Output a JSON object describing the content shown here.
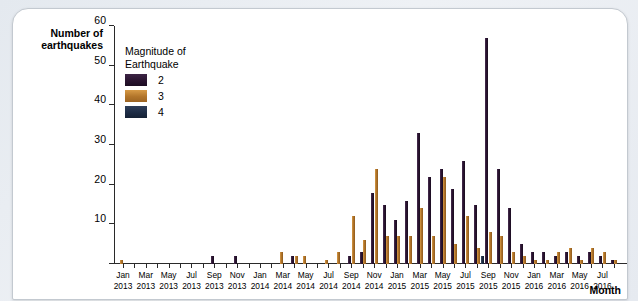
{
  "axes": {
    "y_title": "Number of earthquakes",
    "x_title": "Month",
    "y_ticks": [
      0,
      10,
      20,
      30,
      40,
      50,
      60
    ]
  },
  "legend": {
    "title_line1": "Magnitude of",
    "title_line2": "Earthquake",
    "entries": [
      {
        "label": "2",
        "color": "#2a1430"
      },
      {
        "label": "3",
        "color": "#b2752a"
      },
      {
        "label": "4",
        "color": "#1d2c45"
      }
    ]
  },
  "chart_data": {
    "type": "bar",
    "title": "",
    "xlabel": "Month",
    "ylabel": "Number of earthquakes",
    "ylim": [
      0,
      60
    ],
    "grid": false,
    "legend_position": "inside-top-left",
    "categories": [
      "Jan 2013",
      "Feb 2013",
      "Mar 2013",
      "Apr 2013",
      "May 2013",
      "Jun 2013",
      "Jul 2013",
      "Aug 2013",
      "Sep 2013",
      "Oct 2013",
      "Nov 2013",
      "Dec 2013",
      "Jan 2014",
      "Feb 2014",
      "Mar 2014",
      "Apr 2014",
      "May 2014",
      "Jun 2014",
      "Jul 2014",
      "Aug 2014",
      "Sep 2014",
      "Oct 2014",
      "Nov 2014",
      "Dec 2014",
      "Jan 2015",
      "Feb 2015",
      "Mar 2015",
      "Apr 2015",
      "May 2015",
      "Jun 2015",
      "Jul 2015",
      "Aug 2015",
      "Sep 2015",
      "Oct 2015",
      "Nov 2015",
      "Dec 2015",
      "Jan 2016",
      "Feb 2016",
      "Mar 2016",
      "Apr 2016",
      "May 2016",
      "Jun 2016",
      "Jul 2016",
      "Aug 2016"
    ],
    "tick_labels": [
      {
        "index": 0,
        "line1": "Jan",
        "line2": "2013"
      },
      {
        "index": 2,
        "line1": "Mar",
        "line2": "2013"
      },
      {
        "index": 4,
        "line1": "May",
        "line2": "2013"
      },
      {
        "index": 6,
        "line1": "Jul",
        "line2": "2013"
      },
      {
        "index": 8,
        "line1": "Sep",
        "line2": "2013"
      },
      {
        "index": 10,
        "line1": "Nov",
        "line2": "2013"
      },
      {
        "index": 12,
        "line1": "Jan",
        "line2": "2014"
      },
      {
        "index": 14,
        "line1": "Mar",
        "line2": "2014"
      },
      {
        "index": 16,
        "line1": "May",
        "line2": "2014"
      },
      {
        "index": 18,
        "line1": "Jul",
        "line2": "2014"
      },
      {
        "index": 20,
        "line1": "Sep",
        "line2": "2014"
      },
      {
        "index": 22,
        "line1": "Nov",
        "line2": "2014"
      },
      {
        "index": 24,
        "line1": "Jan",
        "line2": "2015"
      },
      {
        "index": 26,
        "line1": "Mar",
        "line2": "2015"
      },
      {
        "index": 28,
        "line1": "May",
        "line2": "2015"
      },
      {
        "index": 30,
        "line1": "Jul",
        "line2": "2015"
      },
      {
        "index": 32,
        "line1": "Sep",
        "line2": "2015"
      },
      {
        "index": 34,
        "line1": "Nov",
        "line2": "2015"
      },
      {
        "index": 36,
        "line1": "Jan",
        "line2": "2016"
      },
      {
        "index": 38,
        "line1": "Mar",
        "line2": "2016"
      },
      {
        "index": 40,
        "line1": "May",
        "line2": "2016"
      },
      {
        "index": 42,
        "line1": "Jul",
        "line2": "2016"
      }
    ],
    "series": [
      {
        "name": "2",
        "color": "#2a1430",
        "values": [
          0,
          0,
          0,
          0,
          0,
          0,
          0,
          0,
          2,
          0,
          2,
          0,
          0,
          0,
          0,
          2,
          0,
          0,
          0,
          0,
          2,
          3,
          18,
          15,
          11,
          16,
          33,
          22,
          24,
          19,
          26,
          15,
          57,
          24,
          14,
          5,
          3,
          3,
          2,
          3,
          2,
          3,
          2,
          1
        ]
      },
      {
        "name": "3",
        "color": "#b2752a",
        "values": [
          1,
          0,
          0,
          0,
          0,
          0,
          0,
          0,
          0,
          0,
          0,
          0,
          0,
          0,
          3,
          2,
          2,
          0,
          1,
          3,
          12,
          6,
          24,
          7,
          7,
          7,
          14,
          7,
          22,
          5,
          12,
          4,
          8,
          7,
          3,
          2,
          1,
          1,
          3,
          4,
          1,
          4,
          3,
          1
        ]
      },
      {
        "name": "4",
        "color": "#1d2c45",
        "values": [
          0,
          0,
          0,
          0,
          0,
          0,
          0,
          0,
          0,
          0,
          0,
          0,
          0,
          0,
          0,
          0,
          0,
          0,
          0,
          0,
          0,
          0,
          0,
          0,
          0,
          0,
          0,
          0,
          0,
          0,
          0,
          2,
          0,
          0,
          0,
          0,
          0,
          0,
          0,
          0,
          0,
          0,
          0,
          0
        ]
      }
    ]
  }
}
